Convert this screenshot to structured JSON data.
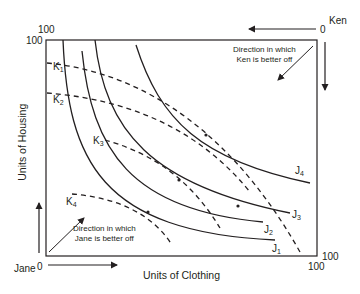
{
  "diagram": {
    "type": "edgeworth_box",
    "x_axis_label": "Units of Clothing",
    "y_axis_label": "Units of Housing",
    "jane": {
      "name": "Jane",
      "origin": "0",
      "note_line1": "Direction in which",
      "note_line2": "Jane is better off"
    },
    "ken": {
      "name": "Ken",
      "origin": "0",
      "note_line1": "Direction in which",
      "note_line2": "Ken is better off"
    },
    "ticks": {
      "top_left_outer": "100",
      "top_left_inner": "100",
      "bottom_right_outer": "100",
      "bottom_right_inner": "100"
    },
    "jane_curves": [
      {
        "base": "J",
        "sub": "1"
      },
      {
        "base": "J",
        "sub": "2"
      },
      {
        "base": "J",
        "sub": "3"
      },
      {
        "base": "J",
        "sub": "4"
      }
    ],
    "ken_curves": [
      {
        "base": "K",
        "sub": "1"
      },
      {
        "base": "K",
        "sub": "2"
      },
      {
        "base": "K",
        "sub": "3"
      },
      {
        "base": "K",
        "sub": "4"
      }
    ],
    "colors": {
      "line": "#231f20",
      "background": "#ffffff"
    }
  }
}
